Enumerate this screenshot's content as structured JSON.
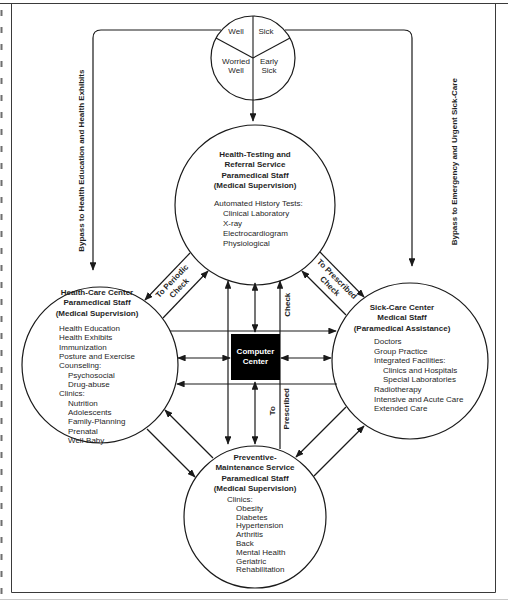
{
  "triage": {
    "well": "Well",
    "sick": "Sick",
    "worried_well": "Worried\nWell",
    "early_sick": "Early\nSick"
  },
  "bypass": {
    "left": "Bypass to Health Education and Health Exhibits",
    "right": "Bypass to Emergency and Urgent Sick-Care"
  },
  "flow_labels": {
    "to_periodic_check": "To Periodic\nCheck",
    "to_prescribed_check": "To Prescribed\nCheck",
    "check": "Check",
    "to": "To",
    "prescribed": "Prescribed"
  },
  "computer_center": {
    "label": "Computer\nCenter"
  },
  "testing_circle": {
    "title": [
      "Health-Testing and",
      "Referral Service",
      "Paramedical Staff",
      "(Medical Supervision)"
    ],
    "items": [
      "Automated History Tests:",
      "Clinical Laboratory",
      "X-ray",
      "Electrocardiogram",
      "Physiological"
    ]
  },
  "health_care_circle": {
    "title": [
      "Health-Care Center",
      "Paramedical Staff",
      "(Medical Supervision)"
    ],
    "items": [
      "Health Education",
      "Health Exhibits",
      "Immunization",
      "Posture and Exercise",
      "Counseling:",
      "Psychosocial",
      "Drug-abuse",
      "Clinics:",
      "Nutrition",
      "Adolescents",
      "Family-Planning",
      "Prenatal",
      "Well-Baby"
    ]
  },
  "sick_care_circle": {
    "title": [
      "Sick-Care Center",
      "Medical Staff",
      "(Paramedical Assistance)"
    ],
    "items": [
      "Doctors",
      "Group Practice",
      "Integrated Facilities:",
      "Clinics and Hospitals",
      "Special Laboratories",
      "Radiotherapy",
      "Intensive and Acute Care",
      "Extended Care"
    ]
  },
  "preventive_circle": {
    "title": [
      "Preventive-",
      "Maintenance Service",
      "Paramedical Staff",
      "(Medical Supervision)"
    ],
    "items": [
      "Clinics:",
      "Obesity",
      "Diabetes",
      "Hypertension",
      "Arthritis",
      "Back",
      "Mental Health",
      "Geriatric",
      "Rehabilitation"
    ]
  },
  "colors": {
    "ink": "#1a1a1a",
    "box_fill": "#000000",
    "box_text": "#ffffff",
    "page_edge": "#c9c9c9"
  }
}
